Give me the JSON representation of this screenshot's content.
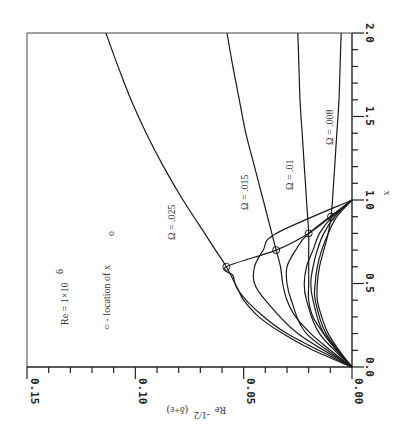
{
  "chart_data": {
    "type": "line",
    "title": "",
    "orientation": "rotated 90 degrees clockwise (x axis runs vertically on right, y axis runs horizontally at bottom)",
    "xlabel": "x",
    "ylabel": "Re^-1/2 (δ+ε)",
    "xlim": [
      0.0,
      2.0
    ],
    "ylim": [
      0.0,
      0.15
    ],
    "x_ticks": [
      "0.0",
      "0.5",
      "1.0",
      "1.5",
      "2.0"
    ],
    "y_ticks": [
      "0.00",
      "0.05",
      "0.10",
      "0.15"
    ],
    "grid": false,
    "annotations": [
      {
        "text": "Re = 1×10^6",
        "label_main": "Re = 1×10",
        "label_sup": "6"
      },
      {
        "text": "○ - location of x_o",
        "label_main": "○ - location of x",
        "label_sub": "o"
      }
    ],
    "series": [
      {
        "name": "Ω = .025",
        "label": "Ω = .025",
        "x": [
          0.0,
          0.1,
          0.2,
          0.3,
          0.4,
          0.45,
          0.5,
          0.6,
          0.7,
          0.8,
          1.0,
          1.2,
          1.4,
          1.6,
          1.8,
          2.0
        ],
        "y": [
          0.0,
          0.018,
          0.032,
          0.043,
          0.05,
          0.052,
          0.054,
          0.058,
          0.063,
          0.068,
          0.078,
          0.087,
          0.095,
          0.102,
          0.108,
          0.1136
        ],
        "marker_x_o": [
          0.6,
          0.058
        ]
      },
      {
        "name": "Ω = .015",
        "label": "Ω = .015",
        "x": [
          0.0,
          0.1,
          0.2,
          0.3,
          0.4,
          0.5,
          0.6,
          0.7,
          0.8,
          1.0,
          1.2,
          1.4,
          1.6,
          1.8,
          2.0
        ],
        "y": [
          0.0,
          0.01,
          0.019,
          0.026,
          0.03,
          0.032,
          0.033,
          0.035,
          0.037,
          0.041,
          0.045,
          0.049,
          0.052,
          0.055,
          0.0577
        ],
        "marker_x_o": [
          0.7,
          0.035
        ]
      },
      {
        "name": "Ω = .01",
        "label": "Ω = .01",
        "x": [
          0.0,
          0.1,
          0.2,
          0.3,
          0.4,
          0.5,
          0.6,
          0.7,
          0.8,
          1.0,
          1.2,
          1.4,
          1.6,
          1.8,
          2.0
        ],
        "y": [
          0.0,
          0.007,
          0.013,
          0.018,
          0.02,
          0.02,
          0.02,
          0.02,
          0.02,
          0.021,
          0.022,
          0.023,
          0.024,
          0.0245,
          0.025
        ],
        "marker_x_o": [
          0.8,
          0.02
        ]
      },
      {
        "name": "Ω = .008",
        "label": "Ω = .008",
        "x": [
          0.0,
          0.1,
          0.2,
          0.3,
          0.4,
          0.5,
          0.6,
          0.7,
          0.8,
          0.9,
          1.0,
          1.2,
          1.4,
          1.6,
          1.8,
          2.0
        ],
        "y": [
          0.0,
          0.006,
          0.011,
          0.014,
          0.016,
          0.016,
          0.015,
          0.013,
          0.011,
          0.0097,
          0.009,
          0.008,
          0.007,
          0.006,
          0.0055,
          0.005
        ],
        "marker_x_o": [
          0.9,
          0.0097
        ]
      }
    ],
    "envelope_curve": {
      "name": "locus of x_o (laminar bubble branches)",
      "x": [
        0.0,
        0.2,
        0.35,
        0.45,
        0.5,
        0.55,
        0.6,
        0.7,
        0.8,
        0.9,
        1.0
      ],
      "y": [
        0.0,
        0.03,
        0.045,
        0.052,
        0.054,
        0.055,
        0.058,
        0.035,
        0.02,
        0.0097,
        0.0
      ]
    },
    "lower_branches": [
      {
        "x": [
          0.0,
          0.2,
          0.4,
          0.5,
          0.6,
          0.7,
          0.8,
          1.0
        ],
        "y": [
          0.0,
          0.025,
          0.04,
          0.045,
          0.045,
          0.041,
          0.035,
          0.0
        ]
      },
      {
        "x": [
          0.0,
          0.2,
          0.4,
          0.5,
          0.6,
          0.7,
          0.8,
          1.0
        ],
        "y": [
          0.0,
          0.021,
          0.028,
          0.03,
          0.03,
          0.026,
          0.02,
          0.0
        ]
      },
      {
        "x": [
          0.0,
          0.2,
          0.4,
          0.5,
          0.6,
          0.7,
          0.8,
          0.9,
          1.0
        ],
        "y": [
          0.0,
          0.015,
          0.021,
          0.022,
          0.021,
          0.018,
          0.015,
          0.009,
          0.0
        ]
      },
      {
        "x": [
          0.0,
          0.2,
          0.4,
          0.5,
          0.6,
          0.7,
          0.8,
          0.9,
          1.0
        ],
        "y": [
          0.0,
          0.013,
          0.018,
          0.019,
          0.018,
          0.016,
          0.013,
          0.008,
          0.0
        ]
      },
      {
        "x": [
          0.0,
          0.2,
          0.4,
          0.5,
          0.6,
          0.7,
          0.8,
          0.9,
          1.0
        ],
        "y": [
          0.0,
          0.012,
          0.017,
          0.017,
          0.016,
          0.014,
          0.011,
          0.007,
          0.0
        ]
      }
    ]
  },
  "labels": {
    "x_axis_label": "x",
    "y_axis_label_main": "Re",
    "y_axis_label_sup": "-1/2",
    "y_axis_label_tail": "(δ+ε)",
    "re_main": "Re = 1×10",
    "re_sup": "6",
    "legend_main": "○ - location of x",
    "legend_sub": "o",
    "omega_025": "Ω = .025",
    "omega_015": "Ω = .015",
    "omega_01": "Ω = .01",
    "omega_008": "Ω = .008",
    "xt_00": "0.0",
    "xt_05": "0.5",
    "xt_10": "1.0",
    "xt_15": "1.5",
    "xt_20": "2.0",
    "yt_000": "0.00",
    "yt_005": "0.05",
    "yt_010": "0.10",
    "yt_015": "0.15"
  }
}
